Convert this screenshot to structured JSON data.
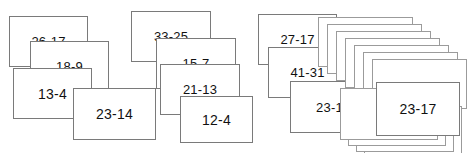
{
  "canvas": {
    "width": 468,
    "height": 153,
    "background_color": "#ffffff",
    "card_fill_color": "#ffffff",
    "card_border_color": "#7a7a7a",
    "card_blank_border_color": "#9b9b9b",
    "label_color": "#111111"
  },
  "groups": [
    {
      "name": "group-1",
      "cards": [
        {
          "label": "26-17",
          "x": 9,
          "y": 16,
          "w": 79,
          "h": 51,
          "font_size": 13
        },
        {
          "label": "18-9",
          "x": 30,
          "y": 41,
          "w": 79,
          "h": 51,
          "font_size": 13
        },
        {
          "label": "13-4",
          "x": 13,
          "y": 68,
          "w": 79,
          "h": 51,
          "font_size": 14
        },
        {
          "label": "23-14",
          "x": 73,
          "y": 88,
          "w": 83,
          "h": 52,
          "font_size": 14
        }
      ]
    },
    {
      "name": "group-2",
      "cards": [
        {
          "label": "33-25",
          "x": 131,
          "y": 11,
          "w": 80,
          "h": 51,
          "font_size": 13
        },
        {
          "label": "15-7",
          "x": 156,
          "y": 38,
          "w": 80,
          "h": 51,
          "font_size": 13
        },
        {
          "label": "21-13",
          "x": 160,
          "y": 64,
          "w": 80,
          "h": 51,
          "font_size": 13
        },
        {
          "label": "12-4",
          "x": 180,
          "y": 96,
          "w": 73,
          "h": 47,
          "font_size": 14
        }
      ]
    },
    {
      "name": "group-3",
      "cards": [
        {
          "label": "27-17",
          "x": 258,
          "y": 14,
          "w": 79,
          "h": 51,
          "font_size": 13
        },
        {
          "label": "41-31",
          "x": 268,
          "y": 47,
          "w": 79,
          "h": 51,
          "font_size": 13
        },
        {
          "label": "23-1",
          "x": 290,
          "y": 81,
          "w": 79,
          "h": 52,
          "font_size": 13
        }
      ],
      "stack_top": {
        "name": "upper-cascade",
        "count": 7,
        "x": 318,
        "y": 17,
        "w": 95,
        "h": 50,
        "dx": 9,
        "dy": 7
      },
      "stack_bottom": {
        "name": "lower-cascade",
        "count": 4,
        "x": 340,
        "y": 88,
        "w": 98,
        "h": 52,
        "dx": 8,
        "dy": 6
      },
      "top_card": {
        "label": "23-17",
        "x": 376,
        "y": 82,
        "w": 84,
        "h": 54,
        "font_size": 14
      }
    }
  ]
}
